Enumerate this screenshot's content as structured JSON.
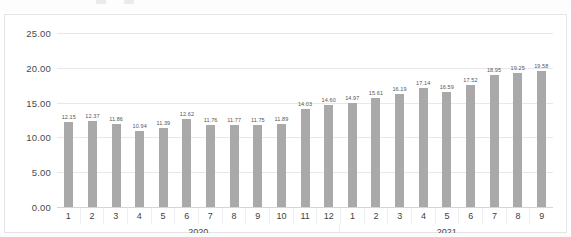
{
  "chart_data": {
    "type": "bar",
    "title": "",
    "xlabel": "",
    "ylabel": "",
    "ylim": [
      0,
      25
    ],
    "ytick_labels": [
      "0.00",
      "5.00",
      "10.00",
      "15.00",
      "20.00",
      "25.00"
    ],
    "ytick_values": [
      0,
      5,
      10,
      15,
      20,
      25
    ],
    "grid": true,
    "legend": "none",
    "bar_color": "#a9a9a9",
    "categories": [
      "1",
      "2",
      "3",
      "4",
      "5",
      "6",
      "7",
      "8",
      "9",
      "10",
      "11",
      "12",
      "1",
      "2",
      "3",
      "4",
      "5",
      "6",
      "7",
      "8",
      "9"
    ],
    "values": [
      12.15,
      12.37,
      11.86,
      10.94,
      11.39,
      12.62,
      11.76,
      11.77,
      11.75,
      11.89,
      14.03,
      14.6,
      14.97,
      15.61,
      16.19,
      17.14,
      16.59,
      17.52,
      18.95,
      19.25,
      19.58
    ],
    "data_labels": [
      "12.15",
      "12.37",
      "11.86",
      "10.94",
      "11.39",
      "12.62",
      "11.76",
      "11.77",
      "11.75",
      "11.89",
      "14.03",
      "14.60",
      "14.97",
      "15.61",
      "16.19",
      "17.14",
      "16.59",
      "17.52",
      "18.95",
      "19.25",
      "19.58"
    ],
    "groups": [
      {
        "label": "2020",
        "span": 12
      },
      {
        "label": "2021",
        "span": 9
      }
    ]
  },
  "ghost": {
    "top_text": "·· ···· · ····· ···· ·· ···· ····"
  }
}
